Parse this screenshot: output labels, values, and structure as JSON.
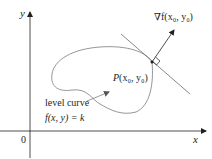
{
  "diagram": {
    "type": "gradient-level-curve",
    "axes": {
      "x_label": "x",
      "y_label": "y",
      "origin_label": "0"
    },
    "point": {
      "label_P": "P",
      "label_coords": "(x₀, y₀)"
    },
    "gradient": {
      "label": "∇f(x₀, y₀)"
    },
    "level_curve": {
      "label_line1": "level curve",
      "label_line2": "f(x, y) = k"
    },
    "colors": {
      "axis": "#231f20",
      "curve": "#808080",
      "text": "#231f20"
    }
  }
}
